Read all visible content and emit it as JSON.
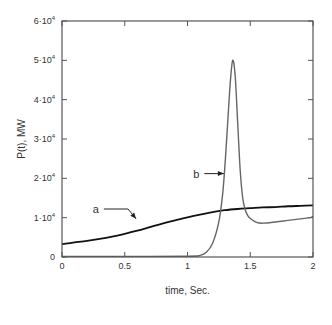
{
  "chart_data": {
    "type": "line",
    "title": "",
    "xlabel": "time, Sec.",
    "ylabel": "P(t), MW",
    "xlim": [
      0,
      2
    ],
    "ylim": [
      0,
      60000
    ],
    "grid": false,
    "legend": "none",
    "x_ticks": [
      {
        "value": 0,
        "label": "0"
      },
      {
        "value": 0.5,
        "label": "0.5"
      },
      {
        "value": 1,
        "label": "1"
      },
      {
        "value": 1.5,
        "label": "1.5"
      },
      {
        "value": 2,
        "label": "2"
      }
    ],
    "y_ticks": [
      {
        "value": 0,
        "label": "0"
      },
      {
        "value": 10000,
        "mant": "1",
        "exp": "4"
      },
      {
        "value": 20000,
        "mant": "2",
        "exp": "4"
      },
      {
        "value": 30000,
        "mant": "3",
        "exp": "4"
      },
      {
        "value": 40000,
        "mant": "4",
        "exp": "4"
      },
      {
        "value": 50000,
        "mant": "5",
        "exp": "4"
      },
      {
        "value": 60000,
        "mant": "6",
        "exp": "4"
      }
    ],
    "series": [
      {
        "name": "a",
        "color": "#111111",
        "width": 1.8,
        "x": [
          0,
          0.1,
          0.2,
          0.3,
          0.4,
          0.5,
          0.6,
          0.7,
          0.8,
          0.9,
          1.0,
          1.1,
          1.2,
          1.3,
          1.4,
          1.5,
          1.6,
          1.7,
          1.8,
          1.9,
          2.0
        ],
        "y": [
          3300,
          3700,
          4100,
          4600,
          5200,
          5900,
          6700,
          7600,
          8500,
          9300,
          10100,
          10800,
          11400,
          11900,
          12200,
          12400,
          12600,
          12700,
          12900,
          13000,
          13100
        ]
      },
      {
        "name": "b",
        "color": "#666666",
        "width": 1.4,
        "x": [
          0,
          0.5,
          1.0,
          1.1,
          1.15,
          1.2,
          1.25,
          1.28,
          1.3,
          1.32,
          1.34,
          1.36,
          1.38,
          1.4,
          1.42,
          1.44,
          1.46,
          1.48,
          1.5,
          1.55,
          1.6,
          1.7,
          1.8,
          1.9,
          1.98,
          2.0
        ],
        "y": [
          150,
          150,
          200,
          400,
          1200,
          3500,
          9000,
          16000,
          24000,
          34000,
          44000,
          50000,
          46000,
          34000,
          22000,
          15000,
          12000,
          10500,
          9800,
          8800,
          8600,
          8900,
          9300,
          9700,
          10000,
          10400
        ]
      }
    ],
    "annotations": [
      {
        "text": "a",
        "series": "a",
        "label_x": 0.27,
        "label_y": 12200,
        "arrow_to_x": 0.59,
        "arrow_to_y": 9700
      },
      {
        "text": "b",
        "series": "b",
        "label_x": 1.07,
        "label_y": 21200,
        "arrow_to_x": 1.29,
        "arrow_to_y": 21200
      }
    ]
  }
}
